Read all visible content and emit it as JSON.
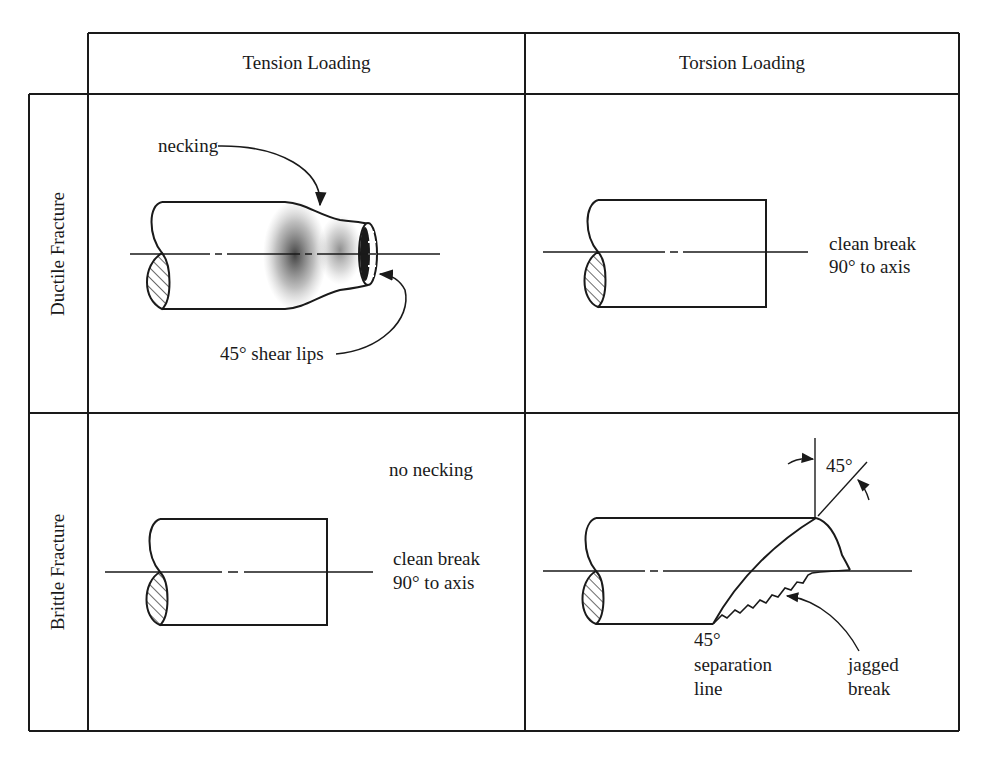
{
  "diagram": {
    "type": "comparison-table",
    "columns": [
      {
        "label": "Tension Loading"
      },
      {
        "label": "Torsion Loading"
      }
    ],
    "rows": [
      {
        "label": "Ductile Fracture"
      },
      {
        "label": "Brittle Fracture"
      }
    ],
    "cells": {
      "ductile_tension": {
        "necking": "necking",
        "shear_lips": "45° shear lips"
      },
      "ductile_torsion": {
        "clean_break_1": "clean break",
        "clean_break_2": "90° to axis"
      },
      "brittle_tension": {
        "no_necking": "no necking",
        "clean_break_1": "clean break",
        "clean_break_2": "90° to axis"
      },
      "brittle_torsion": {
        "angle": "45°",
        "sep_1": "45°",
        "sep_2": "separation",
        "sep_3": "line",
        "jag_1": "jagged",
        "jag_2": "break"
      }
    },
    "colors": {
      "line": "#1a1a1a",
      "background": "#ffffff"
    }
  }
}
